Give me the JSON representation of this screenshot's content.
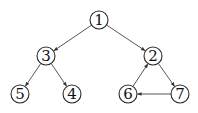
{
  "diagram": {
    "type": "directed-graph",
    "node_radius": 9,
    "colors": {
      "stroke": "#2a2a2a",
      "edge": "#444444",
      "text": "#111111",
      "background": "#ffffff"
    },
    "nodes": [
      {
        "id": "1",
        "label": "1",
        "x": 99,
        "y": 20
      },
      {
        "id": "3",
        "label": "3",
        "x": 46,
        "y": 56
      },
      {
        "id": "2",
        "label": "2",
        "x": 153,
        "y": 56
      },
      {
        "id": "5",
        "label": "5",
        "x": 20,
        "y": 94
      },
      {
        "id": "4",
        "label": "4",
        "x": 72,
        "y": 94
      },
      {
        "id": "6",
        "label": "6",
        "x": 128,
        "y": 94
      },
      {
        "id": "7",
        "label": "7",
        "x": 180,
        "y": 94
      }
    ],
    "edges": [
      {
        "from": "1",
        "to": "3"
      },
      {
        "from": "1",
        "to": "2"
      },
      {
        "from": "3",
        "to": "5"
      },
      {
        "from": "3",
        "to": "4"
      },
      {
        "from": "2",
        "to": "7"
      },
      {
        "from": "7",
        "to": "6"
      },
      {
        "from": "6",
        "to": "2"
      }
    ]
  }
}
